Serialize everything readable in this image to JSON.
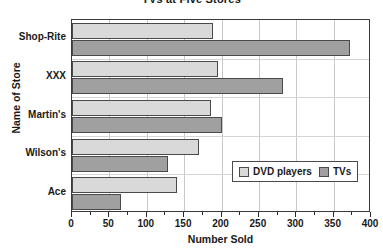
{
  "chart_data": {
    "type": "bar",
    "orientation": "horizontal",
    "title": "TVs at Five Stores",
    "xlabel": "Number Sold",
    "ylabel": "Name of Store",
    "categories": [
      "Shop-Rite",
      "XXX",
      "Martin's",
      "Wilson's",
      "Ace"
    ],
    "series": [
      {
        "name": "DVD players",
        "color": "#d9d9d9",
        "values": [
          188,
          195,
          186,
          170,
          140
        ]
      },
      {
        "name": "TVs",
        "color": "#a0a0a0",
        "values": [
          372,
          282,
          200,
          128,
          65
        ]
      }
    ],
    "xlim": [
      0,
      400
    ],
    "xticks": [
      0,
      50,
      100,
      150,
      200,
      250,
      300,
      350,
      400
    ],
    "xtick_labels": [
      "0",
      "50",
      "100",
      "150",
      "200",
      "250",
      "300",
      "350",
      "400"
    ],
    "minor_tick_step": 25,
    "grid": "vertical",
    "legend_position": "inside-lower-right"
  }
}
